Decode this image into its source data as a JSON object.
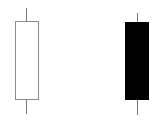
{
  "diagram": {
    "type": "candlestick-comparison",
    "background": "#ffffff",
    "candles": [
      {
        "name": "bullish-candle",
        "fill": "#ffffff",
        "outline": "#8a8a8a",
        "wick_color": "#7a7a7a",
        "body": {
          "x": 15,
          "y": 21,
          "width": 24,
          "height": 79
        },
        "upper_wick": {
          "x": 26,
          "y": 8,
          "height": 13
        },
        "lower_wick": {
          "x": 26,
          "y": 100,
          "height": 14
        }
      },
      {
        "name": "bearish-candle",
        "fill": "#000000",
        "outline": "#000000",
        "wick_color": "#7a7a7a",
        "body": {
          "x": 125,
          "y": 22,
          "width": 24,
          "height": 78
        },
        "upper_wick": {
          "x": 137,
          "y": 13,
          "height": 9
        },
        "lower_wick": {
          "x": 137,
          "y": 100,
          "height": 15
        }
      }
    ]
  }
}
